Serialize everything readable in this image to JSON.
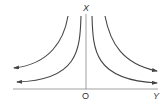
{
  "diagram": {
    "type": "hyperbola-family",
    "labels": {
      "vertical_axis": "X",
      "horizontal_axis": "Y",
      "origin": "O"
    },
    "curves": [
      {
        "name": "outer-left",
        "side": "left"
      },
      {
        "name": "inner-left",
        "side": "left"
      },
      {
        "name": "inner-right",
        "side": "right"
      },
      {
        "name": "outer-right",
        "side": "right"
      }
    ],
    "colors": {
      "line": "#555555",
      "label": "#333333",
      "background": "#ffffff"
    }
  }
}
